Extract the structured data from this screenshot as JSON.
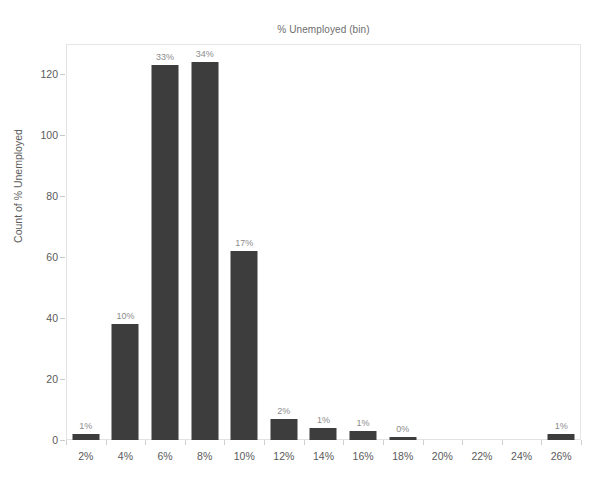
{
  "chart_data": {
    "type": "bar",
    "title": "% Unemployed (bin)",
    "xlabel": "",
    "ylabel": "Count of % Unemployed",
    "categories": [
      "2%",
      "4%",
      "6%",
      "8%",
      "10%",
      "12%",
      "14%",
      "16%",
      "18%",
      "20%",
      "22%",
      "24%",
      "26%"
    ],
    "values": [
      2,
      38,
      123,
      124,
      62,
      7,
      4,
      3,
      1,
      0,
      0,
      0,
      2
    ],
    "bar_labels": [
      "1%",
      "10%",
      "33%",
      "34%",
      "17%",
      "2%",
      "1%",
      "1%",
      "0%",
      "",
      "",
      "",
      "1%"
    ],
    "ylim": [
      0,
      130
    ],
    "yticks": [
      0,
      20,
      40,
      60,
      80,
      100,
      120
    ],
    "ytick_labels": [
      "0",
      "20",
      "40",
      "60",
      "80",
      "100",
      "120"
    ],
    "grid": false,
    "legend": "none",
    "bar_color": "#3d3d3d",
    "label_color": "#8c8c8c",
    "axis_color": "#5a5a5a",
    "border_color": "#e2e2e2",
    "background": "#ffffff"
  }
}
